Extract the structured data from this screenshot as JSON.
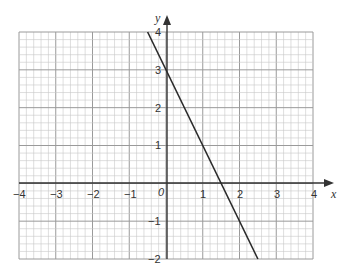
{
  "chart_data": {
    "type": "line",
    "title": "",
    "xlabel": "x",
    "ylabel": "y",
    "xlim": [
      -4,
      4
    ],
    "ylim": [
      -2,
      4
    ],
    "grid": true,
    "minor_grid_per_unit": 5,
    "x_ticks": [
      "-4",
      "-3",
      "-2",
      "-1",
      "0",
      "1",
      "2",
      "3",
      "4"
    ],
    "y_ticks": [
      "-2",
      "-1",
      "1",
      "2",
      "3",
      "4"
    ],
    "origin_label": "0",
    "series": [
      {
        "name": "y = -2x + 3",
        "equation": "y = -2x + 3",
        "x": [
          -0.5,
          2.5
        ],
        "y": [
          4,
          -2
        ]
      }
    ]
  },
  "labels": {
    "x_axis": "x",
    "y_axis": "y",
    "origin": "0",
    "xt": {
      "m4": "−4",
      "m3": "−3",
      "m2": "−2",
      "m1": "−1",
      "p1": "1",
      "p2": "2",
      "p3": "3",
      "p4": "4"
    },
    "yt": {
      "m2": "−2",
      "m1": "−1",
      "p1": "1",
      "p2": "2",
      "p3": "3",
      "p4": "4"
    }
  },
  "colors": {
    "grid_minor": "#c8c8c8",
    "grid_major": "#9a9a9a",
    "axis": "#333333",
    "line": "#2a2a2a"
  }
}
